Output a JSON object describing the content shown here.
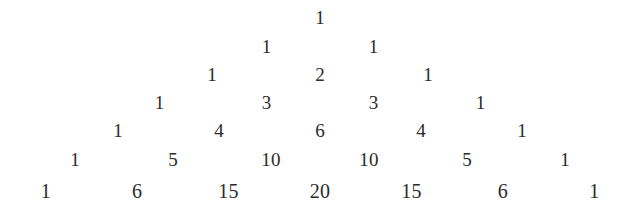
{
  "figure": {
    "name": "pascals-triangle",
    "background_color": "#ffffff",
    "text_color": "#2b2b2b",
    "rows_count": 7
  },
  "chart_data": {
    "type": "table",
    "title": "",
    "subtitle": "",
    "xlabel": "",
    "ylabel": "",
    "legend": [],
    "annotations": [],
    "grid": false,
    "rows": [
      {
        "index": 0,
        "values": [
          "1"
        ]
      },
      {
        "index": 1,
        "values": [
          "1",
          "1"
        ]
      },
      {
        "index": 2,
        "values": [
          "1",
          "2",
          "1"
        ]
      },
      {
        "index": 3,
        "values": [
          "1",
          "3",
          "3",
          "1"
        ]
      },
      {
        "index": 4,
        "values": [
          "1",
          "4",
          "6",
          "4",
          "1"
        ]
      },
      {
        "index": 5,
        "values": [
          "1",
          "5",
          "10",
          "10",
          "5",
          "1"
        ]
      },
      {
        "index": 6,
        "values": [
          "1",
          "6",
          "15",
          "20",
          "15",
          "6",
          "1"
        ]
      }
    ]
  }
}
